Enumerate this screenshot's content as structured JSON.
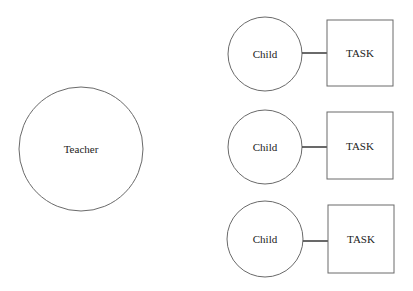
{
  "diagram": {
    "teacher": {
      "label": "Teacher"
    },
    "rows": [
      {
        "child_label": "Child",
        "task_label": "TASK"
      },
      {
        "child_label": "Child",
        "task_label": "TASK"
      },
      {
        "child_label": "Child",
        "task_label": "TASK"
      }
    ]
  },
  "colors": {
    "stroke": "#6a6a6a",
    "connector": "#444444",
    "background": "#ffffff"
  }
}
